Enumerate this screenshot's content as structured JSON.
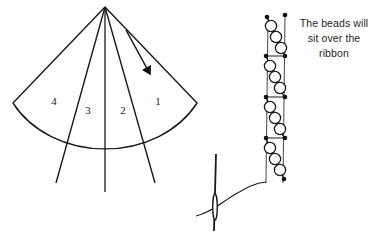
{
  "figure": {
    "title_visible": false,
    "background_color": "#ffffff",
    "ink_color": "#1a1a1a"
  },
  "cone_panel": {
    "name": "cone-fan-diagram",
    "apex": {
      "x": 105,
      "y": 7
    },
    "segment_labels": [
      {
        "id": "segment-4",
        "text": "4",
        "x": 54,
        "y": 101
      },
      {
        "id": "segment-3",
        "text": "3",
        "x": 88,
        "y": 110
      },
      {
        "id": "segment-2",
        "text": "2",
        "x": 123,
        "y": 110
      },
      {
        "id": "segment-1",
        "text": "1",
        "x": 158,
        "y": 101
      }
    ],
    "arrow": {
      "name": "direction-arrow",
      "from": {
        "x": 128,
        "y": 32
      },
      "to": {
        "x": 153,
        "y": 78
      }
    }
  },
  "ribbon_panel": {
    "name": "beaded-ribbon-diagram",
    "ribbon_left_x": 268,
    "ribbon_right_x": 285,
    "ribbon_top_y": 16,
    "ribbon_bottom_y": 182,
    "bead_count": 12,
    "knot_dot_count": 9,
    "needle": {
      "name": "sewing-needle",
      "x": 215,
      "top_y": 155,
      "bottom_y": 231
    }
  },
  "annotation": {
    "name": "beads-over-ribbon-note",
    "lines": [
      "The beads will",
      "sit over the",
      "ribbon"
    ],
    "line1": "The beads will",
    "line2": "sit over the",
    "line3": "ribbon"
  }
}
